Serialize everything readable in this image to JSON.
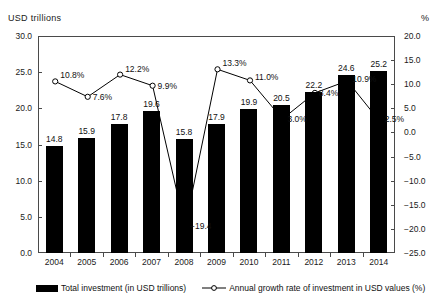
{
  "chart_data": {
    "type": "bar",
    "title": "",
    "xlabel": "",
    "ylabel": "USD trillions",
    "y2label": "%",
    "categories": [
      "2004",
      "2005",
      "2006",
      "2007",
      "2008",
      "2009",
      "2010",
      "2011",
      "2012",
      "2013",
      "2014"
    ],
    "ylim": [
      0.0,
      30.0
    ],
    "y2lim": [
      -25.0,
      20.0
    ],
    "ytick_labels": [
      "30.0",
      "25.0",
      "20.0",
      "15.0",
      "10.0",
      "5.0",
      "0.0"
    ],
    "ytick_values": [
      30.0,
      25.0,
      20.0,
      15.0,
      10.0,
      5.0,
      0.0
    ],
    "y2tick_labels": [
      "20.0",
      "15.0",
      "10.0",
      "5.0",
      "0.0",
      "-5.0",
      "-10.0",
      "-15.0",
      "-20.0",
      "-25.0"
    ],
    "y2tick_values": [
      20.0,
      15.0,
      10.0,
      5.0,
      0.0,
      -5.0,
      -10.0,
      -15.0,
      -20.0,
      -25.0
    ],
    "grid": false,
    "legend_position": "bottom",
    "series": [
      {
        "name": "Total investment (in USD trillions)",
        "type": "bar",
        "axis": "left",
        "color": "#000000",
        "values": [
          14.8,
          15.9,
          17.8,
          19.6,
          15.8,
          17.9,
          19.9,
          20.5,
          22.2,
          24.6,
          25.2
        ],
        "data_labels": [
          "14.8",
          "15.9",
          "17.8",
          "19.6",
          "15.8",
          "17.9",
          "19.9",
          "20.5",
          "22.2",
          "24.6",
          "25.2"
        ]
      },
      {
        "name": "Annual growth rate of investment in USD values (%)",
        "type": "line",
        "axis": "right",
        "color": "#000000",
        "marker": "circle-open",
        "values": [
          10.8,
          7.6,
          12.2,
          9.9,
          -19.4,
          13.3,
          11.0,
          3.0,
          8.4,
          10.9,
          2.5
        ],
        "data_labels": [
          "10.8%",
          "7.6%",
          "12.2%",
          "9.9%",
          "-19.4",
          "13.3%",
          "11.0%",
          "3.0%",
          "8.4%",
          "10.9%",
          "2.5%"
        ]
      }
    ]
  },
  "legend": {
    "bar_label": "Total investment (in USD trillions)",
    "line_label": "Annual growth rate of investment in USD values (%)"
  }
}
